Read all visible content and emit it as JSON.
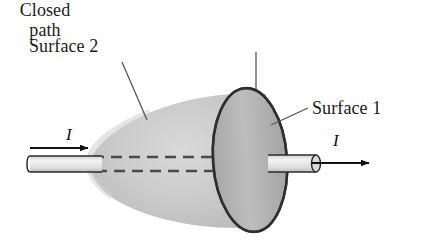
{
  "figure": {
    "type": "physics-diagram",
    "topic": "Amperian closed path with two surfaces bounded by it",
    "background_color": "#ffffff"
  },
  "labels": {
    "surface2": "Surface 2",
    "closed_path_line1": "Closed",
    "closed_path_line2": "path",
    "surface1": "Surface 1",
    "current_left": "I",
    "current_right": "I"
  },
  "colors": {
    "blob_fill": "#c6c6c6",
    "disc_fill": "#b2b2b2",
    "outline": "#3a3a3a",
    "wire_fill": "#e3e3e3",
    "wire_outline": "#2b2b2b",
    "dashed_line": "#4a4a4a",
    "text": "#1a1a1a",
    "arrow": "#111111",
    "leader": "#555555"
  },
  "geometry": {
    "canvas": {
      "width": 423,
      "height": 247
    },
    "blob": {
      "tip_x": 88,
      "right_x": 268,
      "center_y": 160,
      "max_half_height": 66
    },
    "disc": {
      "cx": 250,
      "cy": 160,
      "rx": 37,
      "ry": 72,
      "rotation_deg": -4
    },
    "wire_left": {
      "x1": 28,
      "x2": 100,
      "top_y": 156,
      "bottom_y": 172
    },
    "wire_right": {
      "x1": 268,
      "x2": 318,
      "top_y": 155,
      "bottom_y": 172
    },
    "dashed_lines_y": [
      157,
      171
    ],
    "arrow_left": {
      "x1": 30,
      "x2": 91,
      "y": 148
    },
    "arrow_right": {
      "x1": 312,
      "x2": 372,
      "y": 163
    },
    "leader_surface2": {
      "x1": 122,
      "y1": 62,
      "x2": 146,
      "y2": 119
    },
    "leader_closedpath": {
      "x1": 256,
      "y1": 52,
      "x2": 256,
      "y2": 89
    },
    "leader_surface1": {
      "x1": 307,
      "y1": 108,
      "x2": 272,
      "y2": 124
    }
  }
}
